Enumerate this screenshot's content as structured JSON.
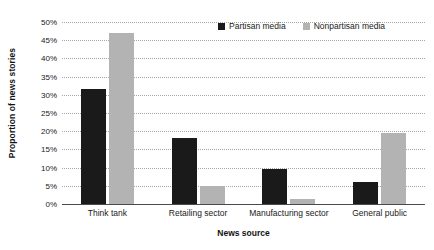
{
  "chart_data": {
    "type": "bar",
    "title": "",
    "xlabel": "News source",
    "ylabel": "Proportion of news stories",
    "categories": [
      "Think tank",
      "Retailing sector",
      "Manufacturing sector",
      "General public"
    ],
    "series": [
      {
        "name": "Partisan media",
        "color": "#1a1a1a",
        "values": [
          31.5,
          18,
          9.5,
          6
        ]
      },
      {
        "name": "Nonpartisan media",
        "color": "#b3b3b3",
        "values": [
          47,
          5,
          1.5,
          19.5
        ]
      }
    ],
    "ylim": [
      0,
      50
    ],
    "ytick_step": 5,
    "ytick_labels": [
      "50%",
      "45%",
      "40%",
      "35%",
      "30%",
      "25%",
      "20%",
      "15%",
      "10%",
      "5%",
      "0%"
    ],
    "ytick_values": [
      50,
      45,
      40,
      35,
      30,
      25,
      20,
      15,
      10,
      5,
      0
    ],
    "grid": true,
    "grid_style": "dotted",
    "grid_color": "#a8a8a8",
    "legend_position": "top-right",
    "background": "#ffffff"
  }
}
